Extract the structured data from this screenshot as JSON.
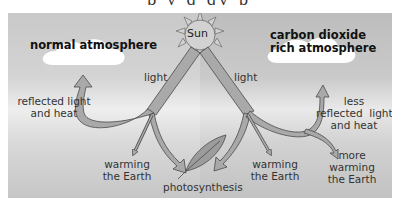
{
  "diagram": {
    "topic": "greenhouse effect comparison",
    "sun": {
      "label": "Sun"
    },
    "left_panel": {
      "title": "normal atmosphere",
      "incoming": "light",
      "reflected": "reflected light\nand heat",
      "reflected_line1": "reflected light",
      "reflected_line2": "and heat",
      "warming_line1": "warming",
      "warming_line2": "the Earth"
    },
    "center": {
      "leaf_label": "photosynthesis"
    },
    "right_panel": {
      "title_line1": "carbon dioxide",
      "title_line2": "rich atmosphere",
      "incoming": "light",
      "reflected_line1": "less",
      "reflected_line2": "reflected  light",
      "reflected_line3": "and heat",
      "warming_line1": "warming",
      "warming_line2": "the Earth",
      "more_warming_line1": "more",
      "more_warming_line2": "warming",
      "more_warming_line3": "the Earth"
    },
    "colors": {
      "arrow_fill": "#a9a9a9",
      "arrow_stroke": "#4a4a4a",
      "sun_fill": "#d2d2d2",
      "cloud": "#ffffff",
      "text": "#333333"
    }
  }
}
